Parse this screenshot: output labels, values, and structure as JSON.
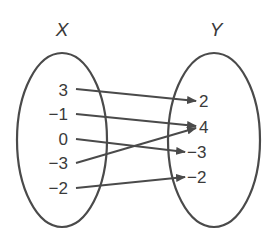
{
  "diagram": {
    "type": "mapping",
    "domain_set": {
      "name": "X",
      "elements": [
        "3",
        "−1",
        "0",
        "−3",
        "−2"
      ]
    },
    "range_set": {
      "name": "Y",
      "elements": [
        "2",
        "4",
        "−3",
        "−2"
      ]
    },
    "mappings": [
      {
        "from": "3",
        "to": "2"
      },
      {
        "from": "−1",
        "to": "4"
      },
      {
        "from": "0",
        "to": "−3"
      },
      {
        "from": "−3",
        "to": "4"
      },
      {
        "from": "−2",
        "to": "−2"
      }
    ],
    "colors": {
      "stroke": "#4a4a4a",
      "text": "#3a3a3a",
      "background": "#ffffff"
    }
  }
}
